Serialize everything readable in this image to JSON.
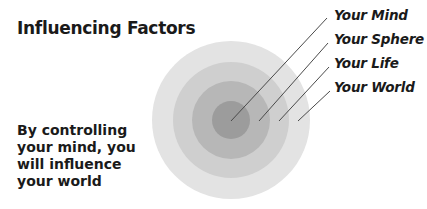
{
  "title": "Influencing Factors",
  "caption": [
    "By controlling",
    "your mind, you",
    "will influence",
    "your world"
  ],
  "labels": [
    "Your Mind",
    "Your Sphere",
    "Your Life",
    "Your World"
  ],
  "rings": [
    {
      "name": "Your World",
      "radius": 79,
      "color": "#e3e3e3"
    },
    {
      "name": "Your Life",
      "radius": 58,
      "color": "#cfcfcf"
    },
    {
      "name": "Your Sphere",
      "radius": 39,
      "color": "#b7b7b7"
    },
    {
      "name": "Your Mind",
      "radius": 19,
      "color": "#9c9c9c"
    }
  ],
  "center": {
    "x": 231,
    "y": 120
  }
}
